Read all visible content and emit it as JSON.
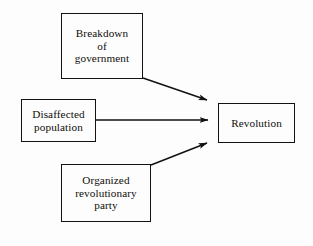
{
  "diagram": {
    "type": "flow-diagram",
    "background_color": "#fdfdfd",
    "line_color": "#14110f",
    "text_color": "#100d0b",
    "nodes": [
      {
        "id": "breakdown",
        "label": "Breakdown\nof\ngovernment",
        "shape": "rectangle",
        "x": 61,
        "y": 13,
        "width": 82,
        "height": 66
      },
      {
        "id": "disaffected",
        "label": "Disaffected\npopulation",
        "shape": "rectangle",
        "x": 21,
        "y": 99,
        "width": 75,
        "height": 43
      },
      {
        "id": "organized",
        "label": "Organized\nrevolutionary\nparty",
        "shape": "rectangle",
        "x": 61,
        "y": 164,
        "width": 90,
        "height": 58
      },
      {
        "id": "revolution",
        "label": "Revolution",
        "shape": "rectangle",
        "x": 218,
        "y": 103,
        "width": 77,
        "height": 40
      }
    ],
    "edges": [
      {
        "id": "edge-breakdown-revolution",
        "from": "breakdown",
        "to": "revolution",
        "style": "solid-arrow",
        "label": "",
        "x1": 143,
        "y1": 78,
        "x2": 210,
        "y2": 101
      },
      {
        "id": "edge-disaffected-revolution",
        "from": "disaffected",
        "to": "revolution",
        "style": "solid-arrow",
        "label": "",
        "x1": 96,
        "y1": 120,
        "x2": 211,
        "y2": 120
      },
      {
        "id": "edge-organized-revolution",
        "from": "organized",
        "to": "revolution",
        "style": "solid-arrow",
        "label": "",
        "x1": 151,
        "y1": 165,
        "x2": 210,
        "y2": 142
      }
    ]
  }
}
